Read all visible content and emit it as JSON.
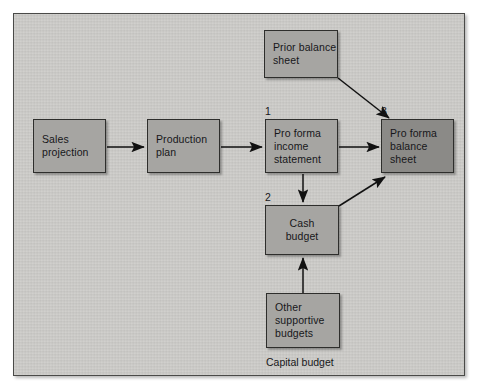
{
  "diagram": {
    "type": "flowchart",
    "colors": {
      "page_background": "#ffffff",
      "frame_background": "#cccbc8",
      "frame_border": "#4a4a48",
      "node_fill": "#a6a5a2",
      "node_fill_dark": "#8b8a87",
      "node_border": "#2e2e2c",
      "text": "#17171a",
      "arrow": "#111111"
    },
    "nodes": [
      {
        "id": "sales-projection",
        "lines": [
          "Sales",
          "projection"
        ],
        "align": "left",
        "shade": "normal",
        "seq": "",
        "x": 32,
        "y": 118,
        "w": 73,
        "h": 54
      },
      {
        "id": "production-plan",
        "lines": [
          "Production",
          "plan"
        ],
        "align": "left",
        "shade": "normal",
        "seq": "",
        "x": 146,
        "y": 118,
        "w": 73,
        "h": 54
      },
      {
        "id": "pro-forma-income-statement",
        "lines": [
          "Pro forma",
          "income",
          "statement"
        ],
        "align": "left",
        "shade": "normal",
        "seq": "1",
        "x": 264,
        "y": 118,
        "w": 73,
        "h": 54
      },
      {
        "id": "pro-forma-balance-sheet",
        "lines": [
          "Pro forma",
          "balance",
          "sheet"
        ],
        "align": "left",
        "shade": "dark",
        "seq": "3",
        "x": 380,
        "y": 118,
        "w": 73,
        "h": 54
      },
      {
        "id": "prior-balance-sheet",
        "lines": [
          "Prior balance",
          "sheet"
        ],
        "align": "left",
        "shade": "normal",
        "seq": "",
        "x": 263,
        "y": 29,
        "w": 73,
        "h": 47
      },
      {
        "id": "cash-budget",
        "lines": [
          "Cash",
          "budget"
        ],
        "align": "center",
        "shade": "normal",
        "seq": "2",
        "x": 264,
        "y": 204,
        "w": 73,
        "h": 50
      },
      {
        "id": "other-supportive-budgets",
        "lines": [
          "Other",
          "supportive",
          "budgets"
        ],
        "align": "left",
        "shade": "normal",
        "seq": "",
        "x": 265,
        "y": 292,
        "w": 73,
        "h": 54
      }
    ],
    "captions": [
      {
        "id": "capital-budget",
        "text": "Capital budget",
        "x": 265,
        "y": 355
      }
    ],
    "edges": [
      {
        "id": "sales-to-production",
        "from": "sales-projection",
        "to": "production-plan"
      },
      {
        "id": "production-to-income",
        "from": "production-plan",
        "to": "pro-forma-income-statement"
      },
      {
        "id": "income-to-balance",
        "from": "pro-forma-income-statement",
        "to": "pro-forma-balance-sheet"
      },
      {
        "id": "income-to-cash",
        "from": "pro-forma-income-statement",
        "to": "cash-budget"
      },
      {
        "id": "prior-balance-to-balance",
        "from": "prior-balance-sheet",
        "to": "pro-forma-balance-sheet"
      },
      {
        "id": "cash-to-balance",
        "from": "cash-budget",
        "to": "pro-forma-balance-sheet"
      },
      {
        "id": "other-budgets-to-cash",
        "from": "other-supportive-budgets",
        "to": "cash-budget"
      }
    ]
  }
}
